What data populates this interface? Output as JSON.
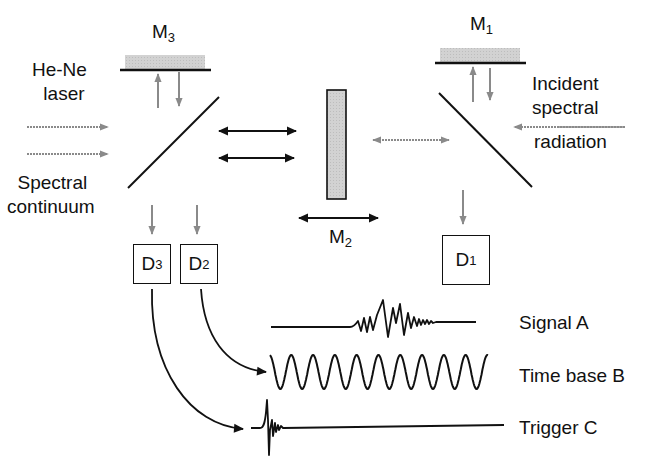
{
  "diagram": {
    "colors": {
      "line": "#111111",
      "beam_gray": "#8a8a8a",
      "mirror_fill": "#cfcfcf"
    },
    "mirrors": {
      "m3": {
        "name": "M",
        "sub": "3"
      },
      "m1": {
        "name": "M",
        "sub": "1"
      },
      "m2": {
        "name": "M",
        "sub": "2"
      }
    },
    "labels": {
      "hene_line1": "He-Ne",
      "hene_line2": "laser",
      "spectral_line1": "Spectral",
      "spectral_line2": "continuum",
      "incident_line1": "Incident",
      "incident_line2": "spectral",
      "incident_line3": "radiation"
    },
    "detectors": [
      {
        "id": "d3",
        "name": "D",
        "sub": "3"
      },
      {
        "id": "d2",
        "name": "D",
        "sub": "2"
      },
      {
        "id": "d1",
        "name": "D",
        "sub": "1"
      }
    ],
    "signals": [
      {
        "id": "signal-a",
        "label": "Signal A"
      },
      {
        "id": "time-base-b",
        "label": "Time base B"
      },
      {
        "id": "trigger-c",
        "label": "Trigger C"
      }
    ]
  }
}
